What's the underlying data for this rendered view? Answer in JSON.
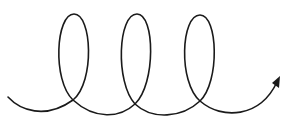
{
  "diagram": {
    "type": "coil-spiral",
    "loop_count": 3,
    "stroke_color": "#1a1a1a",
    "background": "#ffffff",
    "direction": "left-to-right",
    "end_marker": "arrow-icon",
    "caption": ""
  }
}
